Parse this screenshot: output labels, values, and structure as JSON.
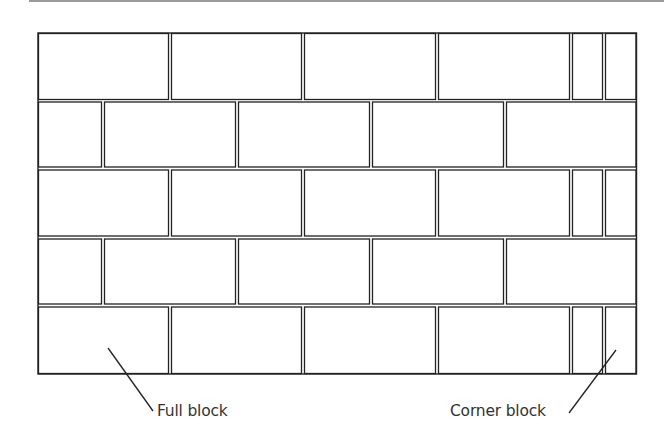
{
  "diagram": {
    "type": "masonry-block-wall-bond",
    "rows": [
      {
        "index": 1,
        "pattern": "full-start",
        "blocks": [
          "full",
          "full",
          "full",
          "full",
          "corner",
          "corner"
        ]
      },
      {
        "index": 2,
        "pattern": "half-start",
        "blocks": [
          "half",
          "full",
          "full",
          "full",
          "full"
        ]
      },
      {
        "index": 3,
        "pattern": "full-start",
        "blocks": [
          "full",
          "full",
          "full",
          "full",
          "corner",
          "corner"
        ]
      },
      {
        "index": 4,
        "pattern": "half-start",
        "blocks": [
          "half",
          "full",
          "full",
          "full",
          "full"
        ]
      },
      {
        "index": 5,
        "pattern": "full-start",
        "blocks": [
          "full",
          "full",
          "full",
          "full",
          "corner",
          "corner"
        ]
      }
    ],
    "colors": {
      "line": "#222222",
      "background": "#ffffff",
      "label": "#333333"
    }
  },
  "labels": {
    "full_block": "Full block",
    "corner_block": "Corner block"
  }
}
